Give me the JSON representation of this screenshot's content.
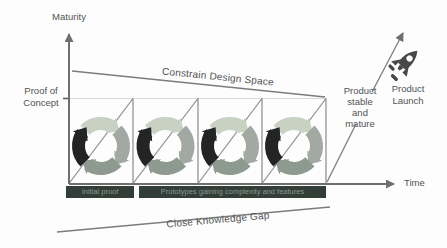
{
  "axes": {
    "y_label": "Maturity",
    "x_label": "Time",
    "y_tick_label": "Proof of\nConcept"
  },
  "annotations": {
    "top_line_label": "Constrain Design Space",
    "bottom_line_label": "Close Knowledge Gap",
    "product_stable_label": "Product\nstable\nand\nmature",
    "product_launch_label": "Product\nLaunch"
  },
  "phase_bars": [
    {
      "label": "Initial proof"
    },
    {
      "label": "Prototypes gaining complexity and features"
    }
  ],
  "iteration_cycles": {
    "count": 4,
    "segment_colors": [
      "#c8d1c2",
      "#a2a8a2",
      "#8e9990",
      "#242424"
    ]
  },
  "colors": {
    "line_gray": "#7c7c7c",
    "tooth_gray": "#8b8b8b",
    "text": "#505254",
    "poc_gridline": "#d9d9d9",
    "bar_background": "#333e39",
    "bar_text": "#87988f",
    "rocket": "#474747"
  }
}
